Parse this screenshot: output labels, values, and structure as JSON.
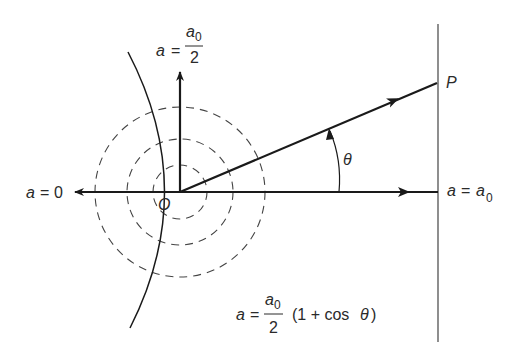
{
  "diagram": {
    "origin_label": "O",
    "point_label": "P",
    "angle_label": "θ",
    "left_arrow_label": {
      "lhs": "a",
      "eq": "=",
      "rhs": "0"
    },
    "right_arrow_label": {
      "lhs": "a",
      "eq": "=",
      "rhs": "a",
      "rhs_sub": "0"
    },
    "up_arrow_label": {
      "lhs": "a",
      "eq": "=",
      "num": "a",
      "num_sub": "0",
      "den": "2"
    },
    "formula": {
      "lhs": "a",
      "eq": "=",
      "num": "a",
      "num_sub": "0",
      "den": "2",
      "tail": "(1 + cos ",
      "theta": "θ",
      "close": ")"
    },
    "colors": {
      "ink": "#1a1a1a",
      "dashed": "#444444"
    }
  }
}
